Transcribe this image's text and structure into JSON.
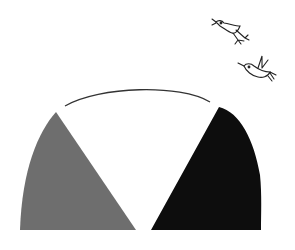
{
  "illustration": {
    "description": "Semicircle divided into three sectors: gray, white (outlined arc), black; two birds flying upper right",
    "colors": {
      "background": "#ffffff",
      "left_sector": "#6e6e6e",
      "middle_sector": "#ffffff",
      "right_sector": "#0d0d0d",
      "outline": "#333333"
    },
    "sectors": [
      {
        "name": "left",
        "fill": "gray"
      },
      {
        "name": "middle",
        "fill": "white"
      },
      {
        "name": "right",
        "fill": "black"
      }
    ],
    "birds": [
      {
        "name": "bird-upper"
      },
      {
        "name": "bird-lower"
      }
    ]
  }
}
